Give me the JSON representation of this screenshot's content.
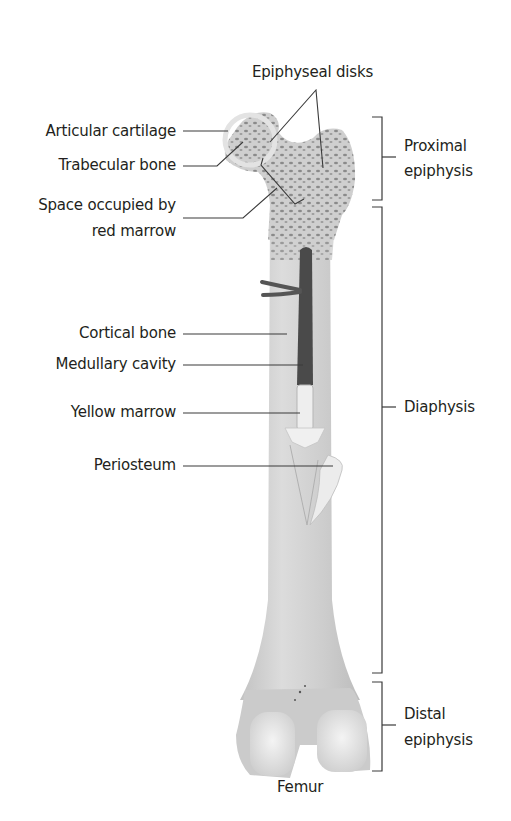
{
  "diagram": {
    "subject": "Femur",
    "caption": "Femur",
    "left_labels": [
      {
        "id": "articular-cartilage",
        "text": "Articular cartilage"
      },
      {
        "id": "trabecular-bone",
        "text": "Trabecular bone"
      },
      {
        "id": "space-red-marrow",
        "line1": "Space occupied by",
        "line2": "red marrow"
      },
      {
        "id": "cortical-bone",
        "text": "Cortical bone"
      },
      {
        "id": "medullary-cavity",
        "text": "Medullary cavity"
      },
      {
        "id": "yellow-marrow",
        "text": "Yellow marrow"
      },
      {
        "id": "periosteum",
        "text": "Periosteum"
      }
    ],
    "top_label": {
      "id": "epiphyseal-disks",
      "text": "Epiphyseal disks"
    },
    "region_labels": [
      {
        "id": "proximal-epiphysis",
        "line1": "Proximal",
        "line2": "epiphysis"
      },
      {
        "id": "diaphysis",
        "text": "Diaphysis"
      },
      {
        "id": "distal-epiphysis",
        "line1": "Distal",
        "line2": "epiphysis"
      }
    ],
    "colors": {
      "bone": "#d4d4d4",
      "bone_shade": "#b9b9b9",
      "cartilage": "#e8e8e8",
      "marrow_cavity": "#4a4a4a",
      "yellow_marrow": "#ededed",
      "leader_line": "#3a3a3a",
      "text": "#231f20"
    }
  }
}
